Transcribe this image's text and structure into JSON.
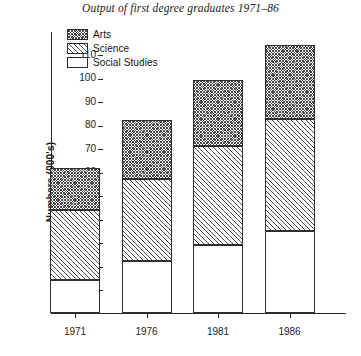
{
  "chart_data": {
    "type": "bar",
    "subtype": "stacked-vertical",
    "title": "Output of first degree graduates 1971–86",
    "xlabel": "",
    "ylabel": "Numbers (000's)",
    "categories": [
      "1971",
      "1976",
      "1981",
      "1986"
    ],
    "series": [
      {
        "name": "Social Studies",
        "values": [
          14,
          22,
          29,
          35
        ],
        "fill": "solid-white"
      },
      {
        "name": "Science",
        "values": [
          30,
          35,
          42,
          47.5
        ],
        "fill": "diagonal-hatch"
      },
      {
        "name": "Arts",
        "values": [
          17.5,
          25,
          28,
          31.5
        ],
        "fill": "cross-hatch"
      }
    ],
    "cumulative_tops": {
      "Social Studies": [
        14,
        22,
        29,
        35
      ],
      "Science": [
        44,
        57,
        71,
        82.5
      ],
      "Arts": [
        61.5,
        82,
        99,
        114
      ]
    },
    "totals": [
      61.5,
      82,
      99,
      114
    ],
    "ylim": [
      0,
      120
    ],
    "yticks": [
      10,
      20,
      30,
      40,
      50,
      60,
      70,
      80,
      90,
      100,
      110
    ],
    "ytick_labels": [
      "10",
      "20",
      "30",
      "40",
      "50",
      "60",
      "70",
      "80",
      "90",
      "100",
      "110"
    ],
    "grid": false,
    "legend_position": "top-left-inside",
    "stack_order_bottom_to_top": [
      "Social Studies",
      "Science",
      "Arts"
    ]
  },
  "legend": {
    "items": [
      {
        "label": "Arts",
        "pattern": "cross-hatch"
      },
      {
        "label": "Science",
        "pattern": "diagonal-hatch"
      },
      {
        "label": "Social Studies",
        "pattern": "empty"
      }
    ]
  },
  "axes": {
    "y_title": "Numbers (000's)"
  }
}
